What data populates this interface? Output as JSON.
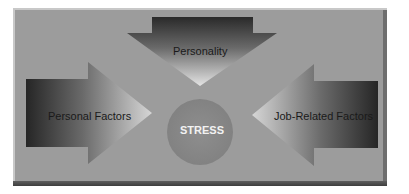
{
  "diagram": {
    "center": {
      "label": "STRESS",
      "color": "#8a8a8a"
    },
    "inputs": [
      {
        "id": "top",
        "label": "Personality",
        "direction": "down"
      },
      {
        "id": "left",
        "label": "Personal Factors",
        "direction": "right"
      },
      {
        "id": "right",
        "label": "Job-Related Factors",
        "direction": "left"
      }
    ],
    "colors": {
      "panel": "#9c9c9c",
      "arrow_dark": "#2e2e2e",
      "arrow_light": "#d8d8d8",
      "frame_shadow": "#4a4a4a"
    }
  }
}
